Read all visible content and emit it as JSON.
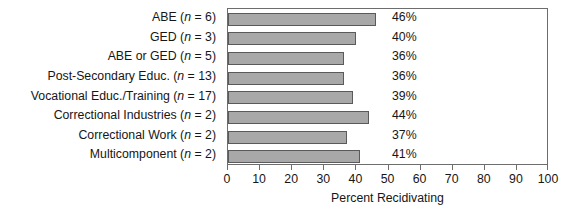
{
  "chart_data": {
    "type": "bar",
    "orientation": "horizontal",
    "title": "",
    "xlabel": "Percent Recidivating",
    "ylabel": "",
    "xlim": [
      0,
      100
    ],
    "xticks": [
      0,
      10,
      20,
      30,
      40,
      50,
      60,
      70,
      80,
      90,
      100
    ],
    "grid": false,
    "legend": null,
    "categories": [
      "ABE (n = 6)",
      "GED (n = 3)",
      "ABE or GED (n = 5)",
      "Post-Secondary Educ. (n = 13)",
      "Vocational Educ./Training (n = 17)",
      "Correctional Industries (n = 2)",
      "Correctional Work (n = 2)",
      "Multicomponent (n = 2)"
    ],
    "category_parts": [
      {
        "name": "ABE",
        "n": "6"
      },
      {
        "name": "GED",
        "n": "3"
      },
      {
        "name": "ABE or GED",
        "n": "5"
      },
      {
        "name": "Post-Secondary Educ.",
        "n": "13"
      },
      {
        "name": "Vocational Educ./Training",
        "n": "17"
      },
      {
        "name": "Correctional Industries",
        "n": "2"
      },
      {
        "name": "Correctional Work",
        "n": "2"
      },
      {
        "name": "Multicomponent",
        "n": "2"
      }
    ],
    "values": [
      46,
      40,
      36,
      36,
      39,
      44,
      37,
      41
    ],
    "data_labels": [
      "46%",
      "40%",
      "36%",
      "36%",
      "39%",
      "44%",
      "37%",
      "41%"
    ],
    "colors": {
      "bar_fill": "#a8a8a8",
      "bar_edge": "#5a5a5a",
      "frame": "#6d6d6d",
      "text": "#161616",
      "background": "#ffffff"
    }
  }
}
